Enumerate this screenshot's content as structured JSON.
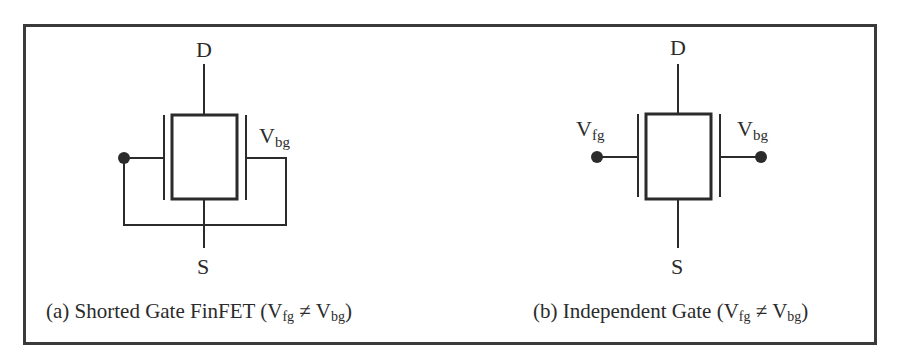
{
  "figure": {
    "panel_a": {
      "drain_label": "D",
      "source_label": "S",
      "back_gate_label": "V",
      "back_gate_sub": "bg",
      "caption": {
        "prefix": "(a) Shorted Gate FinFET (V",
        "sub1": "fg",
        "mid": " ≠ V",
        "sub2": "bg",
        "suffix": ")"
      }
    },
    "panel_b": {
      "drain_label": "D",
      "source_label": "S",
      "front_gate_label": "V",
      "front_gate_sub": "fg",
      "back_gate_label": "V",
      "back_gate_sub": "bg",
      "caption": {
        "prefix": "(b) Independent Gate (V",
        "sub1": "fg",
        "mid": " ≠ V",
        "sub2": "bg",
        "suffix": ")"
      }
    },
    "colors": {
      "line": "#2b2b2b",
      "frame": "#3a3a3a",
      "background": "#ffffff"
    }
  }
}
